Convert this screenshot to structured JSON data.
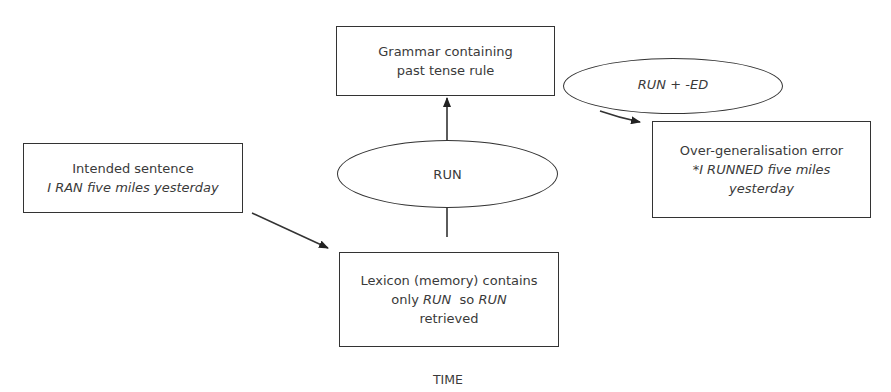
{
  "diagram": {
    "nodes": {
      "grammar": {
        "line1": "Grammar containing",
        "line2": "past tense rule",
        "shape": "rectangle"
      },
      "rule_applied": {
        "label": "RUN + -ED",
        "shape": "ellipse"
      },
      "error": {
        "line1": "Over-generalisation error",
        "line2": "*I RUNNED five miles",
        "line3": "yesterday",
        "shape": "rectangle"
      },
      "intended": {
        "line1": "Intended sentence",
        "line2": "I RAN five miles yesterday",
        "shape": "rectangle"
      },
      "retrieved": {
        "label": "RUN",
        "shape": "ellipse"
      },
      "lexicon": {
        "line1_a": "Lexicon (memory) contains",
        "line2_a": "only ",
        "line2_b": "RUN",
        "line2_c": "  so ",
        "line2_d": "RUN",
        "line3": "retrieved",
        "shape": "rectangle"
      }
    },
    "edges": [
      {
        "from": "intended",
        "to": "lexicon"
      },
      {
        "from": "lexicon",
        "to": "retrieved"
      },
      {
        "from": "retrieved",
        "to": "grammar"
      },
      {
        "from": "rule_applied",
        "to": "error"
      }
    ],
    "axis_label": "TIME",
    "colors": {
      "stroke": "#333333",
      "text": "#3a3a3a",
      "background": "#ffffff"
    }
  }
}
